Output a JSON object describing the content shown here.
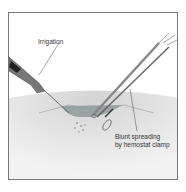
{
  "figure": {
    "labels": {
      "irrigation": "Irrigation",
      "clamp_line1": "Blunt spreading",
      "clamp_line2": "by hemostat clamp"
    },
    "colors": {
      "frame": "#777777",
      "skin": "#e6e6e6",
      "wound": "#9aa2a2",
      "instrument": "#555555"
    }
  }
}
